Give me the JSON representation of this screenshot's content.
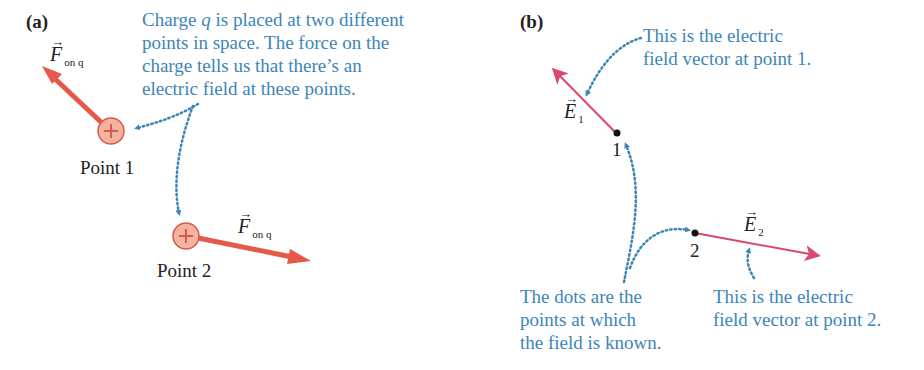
{
  "panel_a": {
    "label": "(a)",
    "note": "Charge q is placed at two different\npoints in space. The force on the\ncharge tells us that there’s an\nelectric field at these points.",
    "note_parts": {
      "pre": "Charge ",
      "q": "q",
      "post": " is placed at two different\npoints in space. The force on the\ncharge tells us that there’s an\nelectric field at these points."
    },
    "point1_label": "Point 1",
    "point2_label": "Point 2",
    "force_symbol": "F",
    "force_subscript": "on q",
    "charge_sign": "+",
    "colors": {
      "arrow": "#e5584a",
      "charge_fill": "#f4b39f",
      "charge_stroke": "#d9594a",
      "note": "#3d85b8"
    }
  },
  "panel_b": {
    "label": "(b)",
    "note_point1": "This is the electric\nfield vector at point 1.",
    "note_point2": "This is the electric\nfield vector at point 2.",
    "note_dots": "The dots are the\npoints at which\nthe field is known.",
    "point1_label": "1",
    "point2_label": "2",
    "e1_symbol": "E",
    "e1_subscript": "1",
    "e2_symbol": "E",
    "e2_subscript": "2",
    "colors": {
      "arrow": "#d9486e",
      "dot": "#111111",
      "note": "#3d85b8"
    }
  }
}
